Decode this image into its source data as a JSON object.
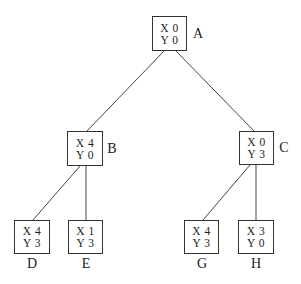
{
  "diagram": {
    "type": "tree",
    "nodes": [
      {
        "id": "A",
        "label": "A",
        "x_line": "X 0",
        "y_line": "Y 0",
        "box": [
          152,
          16,
          35,
          35
        ],
        "label_pos": [
          198,
          34
        ]
      },
      {
        "id": "B",
        "label": "B",
        "x_line": "X 4",
        "y_line": "Y 0",
        "box": [
          67,
          131,
          36,
          35
        ],
        "label_pos": [
          112,
          149
        ]
      },
      {
        "id": "C",
        "label": "C",
        "x_line": "X 0",
        "y_line": "Y 3",
        "box": [
          239,
          131,
          35,
          34
        ],
        "label_pos": [
          284,
          148
        ]
      },
      {
        "id": "D",
        "label": "D",
        "x_line": "X 4",
        "y_line": "Y 3",
        "box": [
          14,
          220,
          36,
          34
        ],
        "label_pos": [
          32,
          264
        ]
      },
      {
        "id": "E",
        "label": "E",
        "x_line": "X 1",
        "y_line": "Y 3",
        "box": [
          68,
          220,
          35,
          34
        ],
        "label_pos": [
          86,
          264
        ]
      },
      {
        "id": "G",
        "label": "G",
        "x_line": "X 4",
        "y_line": "Y 3",
        "box": [
          184,
          220,
          35,
          34
        ],
        "label_pos": [
          202,
          264
        ]
      },
      {
        "id": "H",
        "label": "H",
        "x_line": "X 3",
        "y_line": "Y 0",
        "box": [
          238,
          220,
          36,
          34
        ],
        "label_pos": [
          256,
          264
        ]
      }
    ],
    "edges": [
      {
        "from": "A",
        "to": "B",
        "line": [
          164,
          51,
          87,
          131
        ]
      },
      {
        "from": "A",
        "to": "C",
        "line": [
          176,
          51,
          254,
          131
        ]
      },
      {
        "from": "B",
        "to": "D",
        "line": [
          80,
          166,
          33,
          220
        ]
      },
      {
        "from": "B",
        "to": "E",
        "line": [
          86,
          166,
          86,
          220
        ]
      },
      {
        "from": "C",
        "to": "G",
        "line": [
          250,
          165,
          203,
          220
        ]
      },
      {
        "from": "C",
        "to": "H",
        "line": [
          256,
          165,
          256,
          220
        ]
      }
    ]
  }
}
